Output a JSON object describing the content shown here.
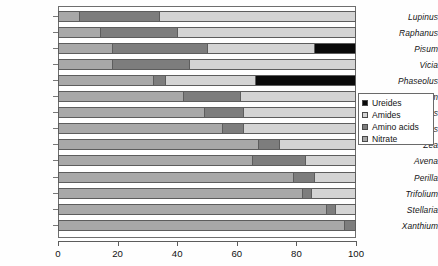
{
  "chart_data": {
    "type": "bar",
    "orientation": "horizontal",
    "stacked": true,
    "title": "",
    "xlabel": "",
    "ylabel": "",
    "xlim": [
      0,
      100
    ],
    "xticks": [
      0,
      20,
      40,
      60,
      80,
      100
    ],
    "xtick_labels": [
      "0",
      "20",
      "40",
      "60",
      "80",
      "100"
    ],
    "grid": false,
    "legend_position": "right",
    "categories": [
      "Lupinus",
      "Raphanus",
      "Pisum",
      "Vicia",
      "Phaseolus",
      "Hordeum",
      "Helianthus",
      "Impatiens",
      "Zea",
      "Avena",
      "Perilla",
      "Trifolium",
      "Stellaria",
      "Xanthium"
    ],
    "series": [
      {
        "name": "Nitrate",
        "color": "#a8a8a8",
        "values": [
          7,
          14,
          18,
          18,
          32,
          42,
          49,
          55,
          67,
          65,
          79,
          82,
          90,
          96
        ]
      },
      {
        "name": "Amino acids",
        "color": "#7d7d7d",
        "values": [
          27,
          26,
          32,
          26,
          4,
          19,
          13,
          7,
          7,
          18,
          7,
          3,
          3,
          4
        ]
      },
      {
        "name": "Amides",
        "color": "#d4d4d4",
        "values": [
          66,
          60,
          36,
          56,
          30,
          39,
          38,
          38,
          26,
          17,
          14,
          15,
          7,
          0
        ]
      },
      {
        "name": "Ureides",
        "color": "#0a0a0a",
        "values": [
          0,
          0,
          14,
          0,
          34,
          0,
          0,
          0,
          0,
          0,
          0,
          0,
          0,
          0
        ]
      }
    ]
  },
  "legend": {
    "items": [
      {
        "label": "Ureides",
        "color": "#0a0a0a"
      },
      {
        "label": "Amides",
        "color": "#d4d4d4"
      },
      {
        "label": "Amino acids",
        "color": "#7d7d7d"
      },
      {
        "label": "Nitrate",
        "color": "#a8a8a8"
      }
    ]
  }
}
